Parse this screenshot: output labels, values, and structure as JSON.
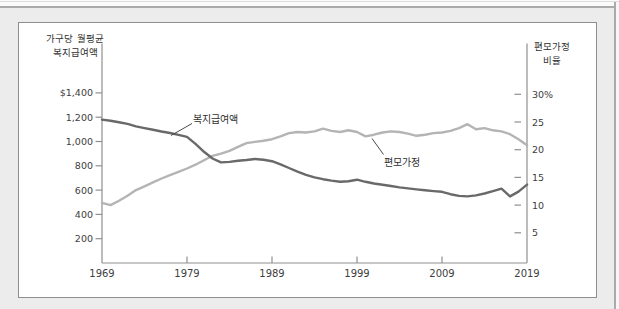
{
  "page": {
    "background_color": "#ececec",
    "card_border_color": "#8e8e8e"
  },
  "chart": {
    "left_axis_title_line1": "가구당 월평균",
    "left_axis_title_line2": "복지급여액",
    "right_axis_title_line1": "편모가정",
    "right_axis_title_line2": "비율",
    "series_label_benefit": "복지급여액",
    "series_label_single_mother": "편모가정",
    "colors": {
      "benefit_line": "#696969",
      "single_mother_line": "#b4b4b4",
      "axis": "#8f8f8f",
      "tick_text": "#3d3d3d",
      "leader": "#4a4a4a"
    }
  },
  "chart_data": {
    "type": "line",
    "grid": false,
    "legend_position": "inline-annotations",
    "annotations": [
      "복지급여액",
      "편모가정"
    ],
    "x_axis": {
      "range": [
        1969,
        2019
      ],
      "ticks": [
        {
          "year": 1969,
          "label": "1969",
          "has_mark": false
        },
        {
          "year": 1979,
          "label": "1979",
          "has_mark": true
        },
        {
          "year": 1989,
          "label": "1989",
          "has_mark": true
        },
        {
          "year": 1999,
          "label": "1999",
          "has_mark": true
        },
        {
          "year": 2009,
          "label": "2009",
          "has_mark": true
        },
        {
          "year": 2019,
          "label": "2019",
          "has_mark": false
        }
      ]
    },
    "left_axis": {
      "label": "가구당 월평균 복지급여액",
      "unit": "USD per month",
      "range": [
        0,
        1500
      ],
      "ticks": [
        {
          "value": 200,
          "label": "200"
        },
        {
          "value": 400,
          "label": "400"
        },
        {
          "value": 600,
          "label": "600"
        },
        {
          "value": 800,
          "label": "800"
        },
        {
          "value": 1000,
          "label": "1,000"
        },
        {
          "value": 1200,
          "label": "1,200"
        },
        {
          "value": 1400,
          "label": "$1,400"
        }
      ]
    },
    "right_axis": {
      "label": "편모가정 비율",
      "unit": "%",
      "range": [
        0,
        32
      ],
      "ticks": [
        {
          "value": 5,
          "label": "5"
        },
        {
          "value": 10,
          "label": "10"
        },
        {
          "value": 15,
          "label": "15"
        },
        {
          "value": 20,
          "label": "20"
        },
        {
          "value": 25,
          "label": "25"
        },
        {
          "value": 30,
          "label": "30%"
        }
      ]
    },
    "x": [
      1969,
      1970,
      1971,
      1972,
      1973,
      1974,
      1975,
      1976,
      1977,
      1978,
      1979,
      1980,
      1981,
      1982,
      1983,
      1984,
      1985,
      1986,
      1987,
      1988,
      1989,
      1990,
      1991,
      1992,
      1993,
      1994,
      1995,
      1996,
      1997,
      1998,
      1999,
      2000,
      2001,
      2002,
      2003,
      2004,
      2005,
      2006,
      2007,
      2008,
      2009,
      2010,
      2011,
      2012,
      2013,
      2014,
      2015,
      2016,
      2017,
      2018,
      2019
    ],
    "series": [
      {
        "name": "복지급여액",
        "axis": "left",
        "values": [
          1180,
          1170,
          1158,
          1145,
          1125,
          1110,
          1096,
          1082,
          1070,
          1055,
          1038,
          980,
          915,
          860,
          828,
          832,
          842,
          848,
          856,
          850,
          838,
          812,
          782,
          752,
          725,
          705,
          690,
          678,
          668,
          673,
          686,
          668,
          654,
          644,
          634,
          622,
          614,
          606,
          598,
          592,
          586,
          566,
          552,
          548,
          556,
          572,
          592,
          612,
          548,
          588,
          645
        ]
      },
      {
        "name": "편모가정 비율",
        "axis": "right",
        "values": [
          10.4,
          10.0,
          10.8,
          11.7,
          12.7,
          13.4,
          14.1,
          14.8,
          15.4,
          16.0,
          16.6,
          17.3,
          18.1,
          18.9,
          19.3,
          19.8,
          20.5,
          21.2,
          21.4,
          21.6,
          21.9,
          22.4,
          23.0,
          23.2,
          23.1,
          23.3,
          23.8,
          23.4,
          23.2,
          23.5,
          23.2,
          22.4,
          22.7,
          23.1,
          23.3,
          23.2,
          22.9,
          22.5,
          22.7,
          23.0,
          23.1,
          23.4,
          23.9,
          24.6,
          23.7,
          23.9,
          23.5,
          23.3,
          22.8,
          21.9,
          20.8
        ]
      }
    ]
  }
}
